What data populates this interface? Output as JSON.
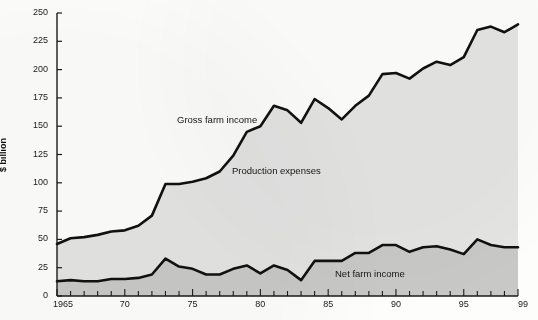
{
  "chart_data": {
    "type": "area",
    "title": "",
    "subtitle": "",
    "xlabel": "",
    "ylabel": "$ billion",
    "ylim": [
      0,
      250
    ],
    "xlim": [
      1965,
      1999
    ],
    "ytick_values": [
      0,
      25,
      50,
      75,
      100,
      125,
      150,
      175,
      200,
      225,
      250
    ],
    "ytick_labels": [
      "0",
      "25",
      "50",
      "75",
      "100",
      "125",
      "150",
      "175",
      "200",
      "225",
      "250"
    ],
    "xtick_values": [
      1965,
      1970,
      1975,
      1980,
      1985,
      1990,
      1995,
      1999
    ],
    "xtick_labels": [
      "1965",
      "70",
      "75",
      "80",
      "85",
      "90",
      "95",
      "99"
    ],
    "xtick_minor_interval": 1,
    "grid": false,
    "legend_position": "inline-annotations",
    "stacked": true,
    "x": [
      1965,
      1966,
      1967,
      1968,
      1969,
      1970,
      1971,
      1972,
      1973,
      1974,
      1975,
      1976,
      1977,
      1978,
      1979,
      1980,
      1981,
      1982,
      1983,
      1984,
      1985,
      1986,
      1987,
      1988,
      1989,
      1990,
      1991,
      1992,
      1993,
      1994,
      1995,
      1996,
      1997,
      1998,
      1999
    ],
    "series": [
      {
        "name": "Gross farm income",
        "color": "#111111",
        "fill": "#e4e5e3",
        "values": [
          46,
          51,
          52,
          54,
          57,
          58,
          62,
          71,
          99,
          99,
          101,
          104,
          110,
          124,
          145,
          150,
          168,
          164,
          153,
          174,
          166,
          156,
          168,
          177,
          196,
          197,
          192,
          201,
          207,
          204,
          211,
          235,
          238,
          233,
          240
        ]
      },
      {
        "name": "Net farm income",
        "color": "#111111",
        "fill": "#c8c9c6",
        "values": [
          13,
          14,
          13,
          13,
          15,
          15,
          16,
          19,
          33,
          26,
          24,
          19,
          19,
          24,
          27,
          20,
          27,
          23,
          14,
          31,
          31,
          31,
          38,
          38,
          45,
          45,
          39,
          43,
          44,
          41,
          37,
          50,
          45,
          43,
          43
        ]
      }
    ],
    "annotations": [
      {
        "text": "Gross farm income",
        "x_px": 177,
        "y_px": 114
      },
      {
        "text": "Production expenses",
        "x_px": 232,
        "y_px": 165
      },
      {
        "text": "Net farm income",
        "x_px": 335,
        "y_px": 268
      }
    ]
  },
  "axes": {
    "y_axis_title": "$ billion",
    "y_tick_labels": [
      "250",
      "225",
      "200",
      "175",
      "150",
      "125",
      "100",
      "75",
      "50",
      "25",
      "0"
    ],
    "x_tick_labels": [
      "1965",
      "70",
      "75",
      "80",
      "85",
      "90",
      "95",
      "99"
    ]
  },
  "labels": {
    "gross": "Gross farm income",
    "expenses": "Production expenses",
    "net": "Net farm income"
  },
  "colors": {
    "axis": "#1a1a1a",
    "line": "#111111",
    "expenses_fill": "#e4e5e3",
    "net_fill": "#c8c9c6",
    "background": "#fdfdfb"
  }
}
